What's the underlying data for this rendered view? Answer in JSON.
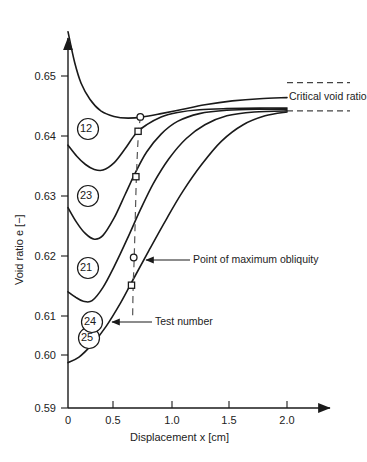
{
  "chart_data": {
    "type": "line",
    "title": "",
    "xlabel": "Displacement x  [cm]",
    "ylabel": "Void ratio e [−]",
    "xlim": [
      0,
      2.4
    ],
    "ylim": [
      0.59,
      0.658
    ],
    "grid": false,
    "legend": "inline-circled-test-numbers",
    "xticks": [
      "0",
      "0.5",
      "1.0",
      "1.5",
      "2.0"
    ],
    "xtick_values": [
      0,
      0.5,
      1.0,
      1.5,
      2.0
    ],
    "yticks": [
      "0.59",
      "0.60",
      "0.61",
      "0.62",
      "0.63",
      "0.64",
      "0.65"
    ],
    "ytick_values": [
      0.59,
      0.6,
      0.61,
      0.62,
      0.63,
      0.64,
      0.65
    ],
    "series": [
      {
        "name": "12",
        "label": "12",
        "points": [
          [
            0.0,
            0.658
          ],
          [
            0.06,
            0.6525
          ],
          [
            0.12,
            0.6487
          ],
          [
            0.2,
            0.6458
          ],
          [
            0.3,
            0.6437
          ],
          [
            0.42,
            0.6427
          ],
          [
            0.55,
            0.6424
          ],
          [
            0.68,
            0.6426
          ],
          [
            0.85,
            0.6432
          ],
          [
            1.05,
            0.644
          ],
          [
            1.25,
            0.6448
          ],
          [
            1.5,
            0.6455
          ],
          [
            1.75,
            0.6459
          ],
          [
            2.0,
            0.6461
          ]
        ],
        "max_obliquity": [
          0.66,
          0.6426
        ],
        "marker": "circle"
      },
      {
        "name": "23",
        "label": "23",
        "points": [
          [
            0.0,
            0.6375
          ],
          [
            0.08,
            0.6355
          ],
          [
            0.16,
            0.634
          ],
          [
            0.24,
            0.6331
          ],
          [
            0.32,
            0.633
          ],
          [
            0.42,
            0.6343
          ],
          [
            0.52,
            0.6368
          ],
          [
            0.62,
            0.6396
          ],
          [
            0.72,
            0.6412
          ],
          [
            0.85,
            0.6426
          ],
          [
            1.0,
            0.6434
          ],
          [
            1.2,
            0.6439
          ],
          [
            1.45,
            0.6441
          ],
          [
            1.75,
            0.6442
          ],
          [
            2.0,
            0.6442
          ]
        ],
        "max_obliquity": [
          0.64,
          0.64
        ],
        "marker": "square"
      },
      {
        "name": "21",
        "label": "21",
        "points": [
          [
            0.0,
            0.6262
          ],
          [
            0.08,
            0.6235
          ],
          [
            0.16,
            0.6215
          ],
          [
            0.24,
            0.6205
          ],
          [
            0.32,
            0.6212
          ],
          [
            0.42,
            0.6243
          ],
          [
            0.52,
            0.6285
          ],
          [
            0.62,
            0.6327
          ],
          [
            0.72,
            0.6363
          ],
          [
            0.85,
            0.6395
          ],
          [
            1.0,
            0.6418
          ],
          [
            1.2,
            0.6432
          ],
          [
            1.45,
            0.6438
          ],
          [
            1.75,
            0.644
          ],
          [
            2.0,
            0.644
          ]
        ],
        "max_obliquity": [
          0.62,
          0.6318
        ],
        "marker": "square"
      },
      {
        "name": "25",
        "label": "25",
        "points": [
          [
            0.0,
            0.611
          ],
          [
            0.07,
            0.61
          ],
          [
            0.14,
            0.6093
          ],
          [
            0.22,
            0.6094
          ],
          [
            0.32,
            0.6118
          ],
          [
            0.42,
            0.6155
          ],
          [
            0.54,
            0.6205
          ],
          [
            0.66,
            0.6258
          ],
          [
            0.78,
            0.6306
          ],
          [
            0.92,
            0.635
          ],
          [
            1.08,
            0.6387
          ],
          [
            1.25,
            0.6412
          ],
          [
            1.45,
            0.6428
          ],
          [
            1.7,
            0.6435
          ],
          [
            2.0,
            0.6437
          ]
        ],
        "max_obliquity": [
          0.6,
          0.6172
        ],
        "marker": "square"
      },
      {
        "name": "24",
        "label": "24",
        "points": [
          [
            0.0,
            0.5982
          ],
          [
            0.1,
            0.5992
          ],
          [
            0.22,
            0.6015
          ],
          [
            0.35,
            0.6048
          ],
          [
            0.48,
            0.609
          ],
          [
            0.6,
            0.6134
          ],
          [
            0.74,
            0.6185
          ],
          [
            0.9,
            0.6242
          ],
          [
            1.05,
            0.6292
          ],
          [
            1.22,
            0.634
          ],
          [
            1.4,
            0.6382
          ],
          [
            1.6,
            0.6412
          ],
          [
            1.8,
            0.6428
          ],
          [
            2.0,
            0.6435
          ]
        ],
        "max_obliquity": [
          0.58,
          0.6122
        ],
        "marker": "circle"
      }
    ],
    "critical_void_ratio": {
      "label": "Critical void ratio",
      "upper_line_value": 0.6488,
      "lower_line_value": 0.6437,
      "line_style": "dashed"
    },
    "obliquity_locus": {
      "label": "Point of maximum obliquity",
      "line_style": "dashed",
      "points": [
        [
          0.665,
          0.6427
        ],
        [
          0.645,
          0.64
        ],
        [
          0.625,
          0.6318
        ],
        [
          0.605,
          0.6172
        ],
        [
          0.595,
          0.6122
        ],
        [
          0.59,
          0.606
        ]
      ]
    },
    "annotations": [
      {
        "name": "point-of-maximum-obliquity",
        "text": "Point of maximum obliquity"
      },
      {
        "name": "test-number",
        "text": "Test number"
      },
      {
        "name": "critical-void-ratio",
        "text": "Critical void ratio"
      }
    ],
    "colors": {
      "ink": "#1a1a1a",
      "dashed": "#555555",
      "caption": "#9a9a9a"
    }
  },
  "figure": {
    "caption": ""
  }
}
